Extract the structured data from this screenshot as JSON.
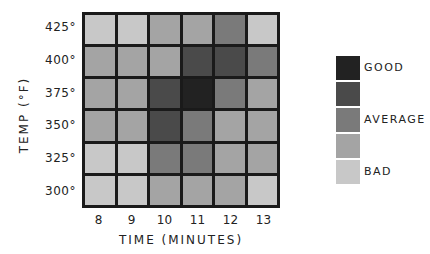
{
  "chart_data": {
    "type": "heatmap",
    "title": "",
    "xlabel": "TIME (MINUTES)",
    "ylabel": "TEMP (°F)",
    "x": [
      "8",
      "9",
      "10",
      "11",
      "12",
      "13"
    ],
    "y": [
      "425°",
      "400°",
      "375°",
      "350°",
      "325°",
      "300°"
    ],
    "values": [
      [
        1,
        1,
        2,
        2,
        3,
        1
      ],
      [
        2,
        2,
        2,
        4,
        4,
        3
      ],
      [
        2,
        2,
        4,
        5,
        3,
        2
      ],
      [
        2,
        2,
        4,
        3,
        2,
        2
      ],
      [
        1,
        1,
        3,
        3,
        2,
        2
      ],
      [
        1,
        1,
        2,
        2,
        2,
        1
      ]
    ],
    "scale": {
      "levels": [
        5,
        4,
        3,
        2,
        1
      ],
      "colors": {
        "5": "#222222",
        "4": "#4a4a4a",
        "3": "#7a7a7a",
        "2": "#a4a4a4",
        "1": "#c8c8c8"
      },
      "labels": {
        "5": "GOOD",
        "3": "AVERAGE",
        "1": "BAD"
      }
    },
    "legend_position": "right",
    "grid": true
  }
}
